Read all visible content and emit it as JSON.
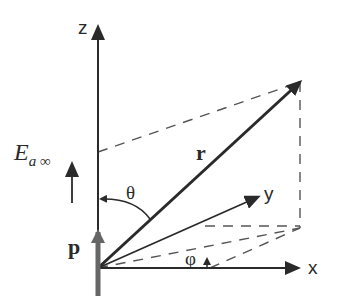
{
  "diagram": {
    "type": "coordinate-system",
    "axes": {
      "z": "z",
      "x": "x",
      "y": "y"
    },
    "vectors": {
      "r": "r",
      "p": "p"
    },
    "angles": {
      "theta": "θ",
      "phi": "φ"
    },
    "field": {
      "symbol": "E",
      "subscript": "a ∞"
    },
    "colors": {
      "ink": "#2a2a2a",
      "p_vector": "#666666",
      "dashed": "#555555"
    }
  }
}
